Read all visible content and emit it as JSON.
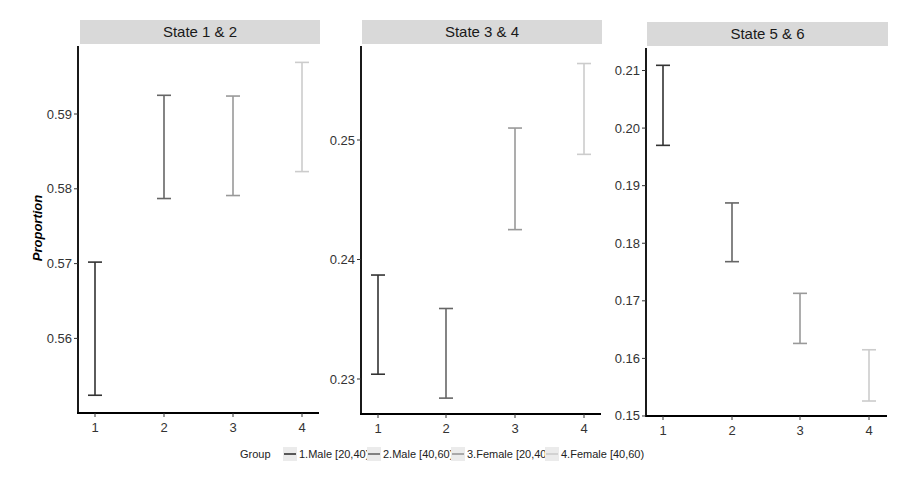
{
  "chart_data": {
    "type": "errorbar",
    "ylabel": "Proportion",
    "xlabel": "",
    "legend": {
      "title": "Group",
      "position": "bottom",
      "entries": [
        {
          "label": "1.Male [20,40)",
          "color": "#333333"
        },
        {
          "label": "2.Male [40,60)",
          "color": "#666666"
        },
        {
          "label": "3.Female [20,40)",
          "color": "#999999"
        },
        {
          "label": "4.Female [40,60)",
          "color": "#cccccc"
        }
      ]
    },
    "categories": [
      "1",
      "2",
      "3",
      "4"
    ],
    "panels": [
      {
        "title": "State 1 & 2",
        "ylim": [
          0.55,
          0.599
        ],
        "yticks": [
          0.56,
          0.57,
          0.58,
          0.59
        ],
        "ytick_labels": [
          "0.56",
          "0.57",
          "0.58",
          "0.59"
        ],
        "series": [
          {
            "group": "1.Male [20,40)",
            "x": 1,
            "lower": 0.5524,
            "upper": 0.5702
          },
          {
            "group": "2.Male [40,60)",
            "x": 2,
            "lower": 0.5787,
            "upper": 0.5925
          },
          {
            "group": "3.Female [20,40)",
            "x": 3,
            "lower": 0.5791,
            "upper": 0.5924
          },
          {
            "group": "4.Female [40,60)",
            "x": 4,
            "lower": 0.5823,
            "upper": 0.5969
          }
        ]
      },
      {
        "title": "State 3 & 4",
        "ylim": [
          0.227,
          0.258
        ],
        "yticks": [
          0.23,
          0.24,
          0.25
        ],
        "ytick_labels": [
          "0.23",
          "0.24",
          "0.25"
        ],
        "series": [
          {
            "group": "1.Male [20,40)",
            "x": 1,
            "lower": 0.2304,
            "upper": 0.2387
          },
          {
            "group": "2.Male [40,60)",
            "x": 2,
            "lower": 0.2284,
            "upper": 0.2359
          },
          {
            "group": "3.Female [20,40)",
            "x": 3,
            "lower": 0.2425,
            "upper": 0.251
          },
          {
            "group": "4.Female [40,60)",
            "x": 4,
            "lower": 0.2488,
            "upper": 0.2564
          }
        ]
      },
      {
        "title": "State 5 & 6",
        "ylim": [
          0.15,
          0.213
        ],
        "yticks": [
          0.15,
          0.16,
          0.17,
          0.18,
          0.19,
          0.2,
          0.21
        ],
        "ytick_labels": [
          "0.15",
          "0.16",
          "0.17",
          "0.18",
          "0.19",
          "0.20",
          "0.21"
        ],
        "series": [
          {
            "group": "1.Male [20,40)",
            "x": 1,
            "lower": 0.197,
            "upper": 0.2109
          },
          {
            "group": "2.Male [40,60)",
            "x": 2,
            "lower": 0.1768,
            "upper": 0.187
          },
          {
            "group": "3.Female [20,40)",
            "x": 3,
            "lower": 0.1626,
            "upper": 0.1713
          },
          {
            "group": "4.Female [40,60)",
            "x": 4,
            "lower": 0.1526,
            "upper": 0.1615
          }
        ]
      }
    ]
  },
  "style": {
    "strip_fill": "#d9d9d9",
    "axis_color": "#000000",
    "legend_key_fill": "#ebebeb"
  }
}
